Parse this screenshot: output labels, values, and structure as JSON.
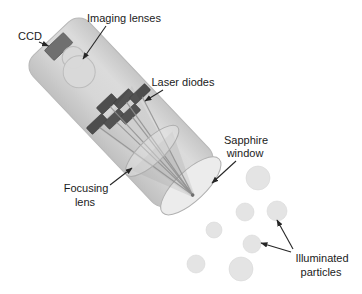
{
  "figure": {
    "type": "schematic-diagram"
  },
  "labels": {
    "ccd": "CCD",
    "imaging_lenses": "Imaging lenses",
    "laser_diodes": "Laser diodes",
    "sapphire_window": {
      "line1": "Sapphire",
      "line2": "window"
    },
    "focusing_lens": {
      "line1": "Focusing",
      "line2": "lens"
    },
    "illuminated_particles": {
      "line1": "Illuminated",
      "line2": "particles"
    }
  },
  "colors": {
    "background": "#ffffff",
    "tube_body": "#d4d4d4",
    "tube_outline": "#b8b8b8",
    "ccd": "#6f6f6f",
    "laser_diode": "#4d4d4d",
    "lens": "#d9d9d9",
    "sapphire_window": "#ececec",
    "beam": "#8f8f8f",
    "particle": "#e4e4e4",
    "text": "#1b1b1b",
    "arrow": "#262626"
  },
  "particles": [
    {
      "cx": 258,
      "cy": 178,
      "r": 12
    },
    {
      "cx": 245,
      "cy": 212,
      "r": 9
    },
    {
      "cx": 277,
      "cy": 211,
      "r": 10
    },
    {
      "cx": 214,
      "cy": 230,
      "r": 8
    },
    {
      "cx": 252,
      "cy": 244,
      "r": 9
    },
    {
      "cx": 196,
      "cy": 264,
      "r": 9
    },
    {
      "cx": 241,
      "cy": 269,
      "r": 12
    }
  ],
  "diodes": [
    {
      "x": 132.9,
      "y": 52.4
    },
    {
      "x": 141.0,
      "y": 36.7
    },
    {
      "x": 148.4,
      "y": 21.6
    },
    {
      "x": 140.6,
      "y": 73.5
    },
    {
      "x": 148.7,
      "y": 57.6
    },
    {
      "x": 156.1,
      "y": 42.6
    }
  ],
  "beams": {
    "sources": [
      [
        137,
        52
      ],
      [
        145,
        37
      ],
      [
        152,
        22
      ],
      [
        145,
        74
      ],
      [
        153,
        58
      ],
      [
        160,
        43
      ]
    ],
    "focus": [
      258,
      53
    ]
  }
}
